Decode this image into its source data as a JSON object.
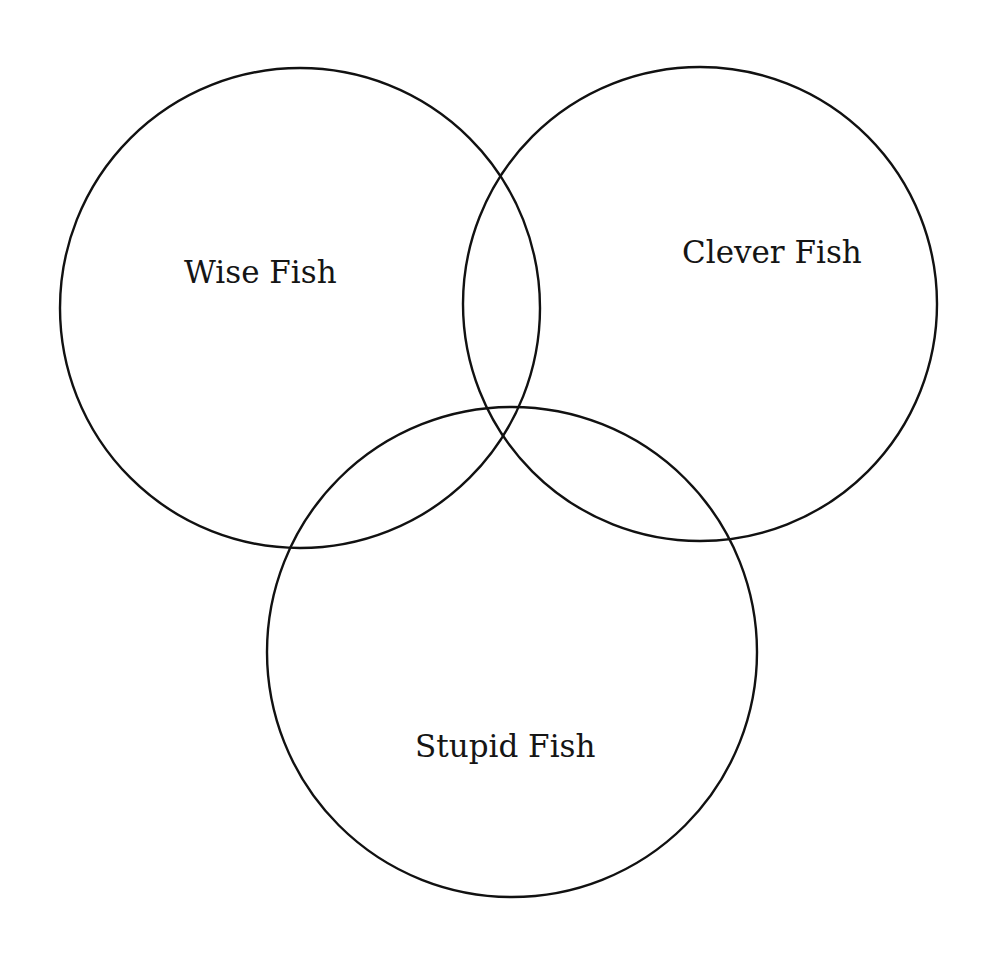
{
  "diagram": {
    "type": "venn",
    "background": "#ffffff",
    "stroke_color": "#111111",
    "text_color": "#151515",
    "sets": [
      {
        "id": "wise",
        "label": "Wise Fish",
        "cx": 300,
        "cy": 308,
        "r": 240,
        "label_x": 184,
        "label_y": 283
      },
      {
        "id": "clever",
        "label": "Clever Fish",
        "cx": 700,
        "cy": 304,
        "r": 237,
        "label_x": 682,
        "label_y": 263
      },
      {
        "id": "stupid",
        "label": "Stupid Fish",
        "cx": 512,
        "cy": 652,
        "r": 245,
        "label_x": 415,
        "label_y": 757
      }
    ]
  }
}
